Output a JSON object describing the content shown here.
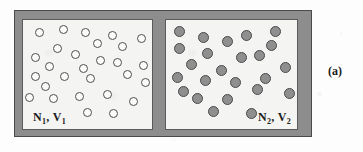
{
  "figure": {
    "panel_caption": "(a)",
    "background_color": "#fdfdfd"
  },
  "vessel": {
    "wall_color": "#8d8d8d",
    "wall_outline_color": "#4a4a4a",
    "chamber_background_color": "#f4f4f2"
  },
  "chambers": [
    {
      "id": "left",
      "label_prefix": "N",
      "label_sub_1": "1",
      "label_middle": ", V",
      "label_sub_2": "1",
      "particle_style": "hollow",
      "particle_fill": "#fbfbfa",
      "particle_outline": "#4f4f4f",
      "particle_count": 28,
      "particles": [
        {
          "x": 12,
          "y": 8
        },
        {
          "x": 36,
          "y": 5
        },
        {
          "x": 58,
          "y": 8
        },
        {
          "x": 85,
          "y": 11
        },
        {
          "x": 114,
          "y": 14
        },
        {
          "x": 70,
          "y": 19
        },
        {
          "x": 30,
          "y": 24
        },
        {
          "x": 48,
          "y": 30
        },
        {
          "x": 95,
          "y": 22
        },
        {
          "x": 8,
          "y": 33
        },
        {
          "x": 73,
          "y": 36
        },
        {
          "x": 90,
          "y": 38
        },
        {
          "x": 22,
          "y": 42
        },
        {
          "x": 56,
          "y": 44
        },
        {
          "x": 116,
          "y": 41
        },
        {
          "x": 8,
          "y": 52
        },
        {
          "x": 37,
          "y": 52
        },
        {
          "x": 63,
          "y": 54
        },
        {
          "x": 100,
          "y": 50
        },
        {
          "x": 118,
          "y": 58
        },
        {
          "x": 18,
          "y": 62
        },
        {
          "x": 2,
          "y": 73
        },
        {
          "x": 26,
          "y": 74
        },
        {
          "x": 52,
          "y": 72
        },
        {
          "x": 80,
          "y": 70
        },
        {
          "x": 106,
          "y": 77
        },
        {
          "x": 60,
          "y": 88
        },
        {
          "x": 86,
          "y": 89
        }
      ]
    },
    {
      "id": "right",
      "label_prefix": "N",
      "label_sub_1": "2",
      "label_middle": ", V",
      "label_sub_2": "2",
      "particle_style": "filled",
      "particle_fill": "#8f8f8f",
      "particle_outline": "#4a4a4a",
      "particle_count": 24,
      "particles": [
        {
          "x": 8,
          "y": 6
        },
        {
          "x": 32,
          "y": 12
        },
        {
          "x": 56,
          "y": 16
        },
        {
          "x": 75,
          "y": 10
        },
        {
          "x": 104,
          "y": 6
        },
        {
          "x": 8,
          "y": 23
        },
        {
          "x": 36,
          "y": 28
        },
        {
          "x": 20,
          "y": 39
        },
        {
          "x": 70,
          "y": 32
        },
        {
          "x": 88,
          "y": 30
        },
        {
          "x": 50,
          "y": 45
        },
        {
          "x": 114,
          "y": 42
        },
        {
          "x": 6,
          "y": 52
        },
        {
          "x": 34,
          "y": 55
        },
        {
          "x": 64,
          "y": 57
        },
        {
          "x": 94,
          "y": 53
        },
        {
          "x": 118,
          "y": 68
        },
        {
          "x": 26,
          "y": 73
        },
        {
          "x": 56,
          "y": 74
        },
        {
          "x": 42,
          "y": 86
        },
        {
          "x": 80,
          "y": 88
        },
        {
          "x": 100,
          "y": 20
        },
        {
          "x": 12,
          "y": 66
        },
        {
          "x": 86,
          "y": 64
        }
      ]
    }
  ]
}
